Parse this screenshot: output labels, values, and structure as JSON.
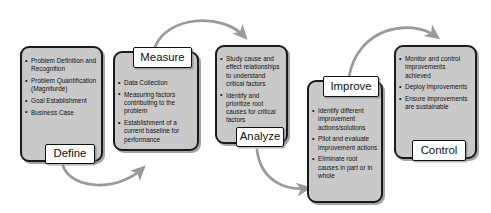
{
  "diagram": {
    "accent_fill": "#c9c9c9",
    "stroke_color": "#1a1a1a",
    "arrow_color": "#9a9a9a",
    "label_fill": "#ffffff"
  },
  "phases": [
    {
      "key": "define",
      "label": "Define",
      "bullets": [
        "Problem Definition and Recognition",
        "Problem Quantification (Magniturde)",
        "Goal Establishment",
        "Business Case"
      ]
    },
    {
      "key": "measure",
      "label": "Measure",
      "bullets": [
        "Data Collection",
        "Measuring factors contributing to the problem",
        "Establishment of a current baseline for performance"
      ]
    },
    {
      "key": "analyze",
      "label": "Analyze",
      "bullets": [
        "Study cause and effect relationships to understand critical factors",
        "Identify and prioritize root causes for critical factors"
      ]
    },
    {
      "key": "improve",
      "label": "Improve",
      "bullets": [
        "Identify different improvement actions/solutions",
        "Pilot and evaluate improvement actions",
        "Eliminate root causes in part or in whole"
      ]
    },
    {
      "key": "control",
      "label": "Control",
      "bullets": [
        "Monitor and control improvements achieved",
        "Deploy improvements",
        "Ensure improvements are sustainable"
      ]
    }
  ],
  "connectors": [
    {
      "key": "define-to-measure",
      "from": "define",
      "to": "measure",
      "direction": "down-right"
    },
    {
      "key": "measure-to-analyze",
      "from": "measure",
      "to": "analyze",
      "direction": "up-right"
    },
    {
      "key": "analyze-to-improve",
      "from": "analyze",
      "to": "improve",
      "direction": "down-right"
    },
    {
      "key": "improve-to-control",
      "from": "improve",
      "to": "control",
      "direction": "up-right"
    }
  ]
}
